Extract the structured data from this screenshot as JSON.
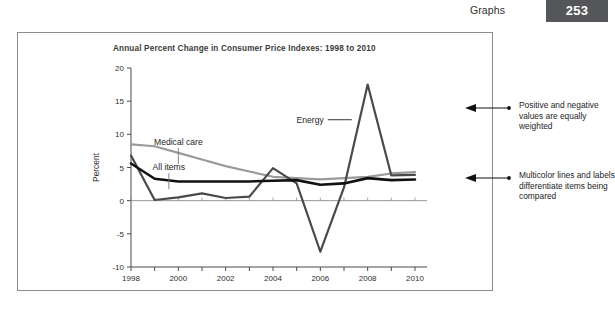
{
  "header": {
    "section_label": "Graphs",
    "page_number": "253",
    "page_number_bg": "#55565a"
  },
  "chart_data": {
    "type": "line",
    "title": "Annual Percent Change in Consumer Price Indexes: 1998 to 2010",
    "xlabel": "",
    "ylabel": "Percent",
    "ylim": [
      -10,
      20
    ],
    "xlim": [
      1998,
      2010
    ],
    "yticks": [
      20,
      15,
      10,
      5,
      0,
      -5,
      -10
    ],
    "xticks": [
      1998,
      1999,
      2000,
      2001,
      2002,
      2003,
      2004,
      2005,
      2006,
      2007,
      2008,
      2009,
      2010
    ],
    "xtick_labels": [
      "1998",
      "",
      "2000",
      "",
      "2002",
      "",
      "2004",
      "",
      "2006",
      "",
      "2008",
      "",
      "2010"
    ],
    "grid": false,
    "legend": "inline-labels",
    "x": [
      1998,
      1999,
      2000,
      2001,
      2002,
      2003,
      2004,
      2005,
      2006,
      2007,
      2008,
      2009,
      2010
    ],
    "series": [
      {
        "name": "All items",
        "color": "#111111",
        "width": 2.6,
        "values": [
          5.6,
          3.3,
          2.9,
          2.9,
          2.9,
          2.9,
          3.0,
          3.1,
          2.4,
          2.6,
          3.4,
          3.1,
          3.2
        ]
      },
      {
        "name": "Medical care",
        "color": "#9a9a9a",
        "width": 2.2,
        "values": [
          8.5,
          8.2,
          7.2,
          6.2,
          5.2,
          4.4,
          3.6,
          3.4,
          3.2,
          3.4,
          3.6,
          4.1,
          4.3
        ]
      },
      {
        "name": "Energy",
        "color": "#4a4a4a",
        "width": 2.2,
        "values": [
          6.8,
          0.1,
          0.5,
          1.1,
          0.4,
          0.6,
          4.9,
          2.6,
          -7.7,
          2.0,
          17.5,
          3.8,
          3.9
        ]
      }
    ],
    "annotations": [
      {
        "text": "Energy",
        "x": 2006.4,
        "y": 12.2
      },
      {
        "text": "Medical care",
        "x": 2000.0,
        "y": 8.4
      },
      {
        "text": "All items",
        "x": 1999.6,
        "y": 4.6
      }
    ]
  },
  "callouts": [
    {
      "text": "Positive and negative values are equally weighted"
    },
    {
      "text": "Multicolor lines and labels differentiate items being compared"
    }
  ]
}
